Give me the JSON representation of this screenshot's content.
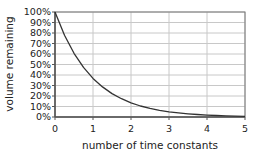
{
  "chart_data": {
    "type": "line",
    "title": "",
    "xlabel": "number of time constants",
    "ylabel": "volume remaining",
    "x_ticks": [
      "0",
      "1",
      "2",
      "3",
      "4",
      "5"
    ],
    "y_ticks": [
      "100%",
      "90%",
      "80%",
      "70%",
      "60%",
      "50%",
      "40%",
      "30%",
      "20%",
      "10%",
      "0%"
    ],
    "xlim": [
      0,
      5
    ],
    "ylim": [
      0,
      100
    ],
    "grid": true,
    "legend": "none",
    "series": [
      {
        "name": "volume remaining",
        "color": "#333333",
        "x": [
          0,
          0.25,
          0.5,
          0.75,
          1,
          1.25,
          1.5,
          1.75,
          2,
          2.25,
          2.5,
          2.75,
          3,
          3.25,
          3.5,
          3.75,
          4,
          4.25,
          4.5,
          4.75,
          5
        ],
        "values": [
          100,
          77.9,
          60.7,
          47.2,
          36.8,
          28.7,
          22.3,
          17.4,
          13.5,
          10.5,
          8.2,
          6.4,
          5.0,
          3.9,
          3.0,
          2.4,
          1.8,
          1.4,
          1.1,
          0.9,
          0.7
        ]
      }
    ]
  },
  "colors": {
    "grid": "#c8c8c8",
    "axis": "#555555",
    "border": "#777777",
    "line": "#333333"
  }
}
